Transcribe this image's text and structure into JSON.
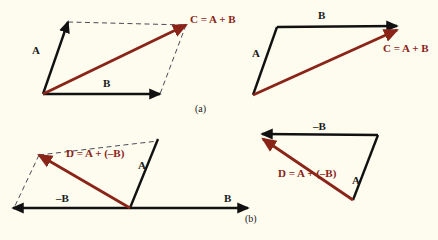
{
  "figure": {
    "background_color": "#fdfcee",
    "vector_black": "#111111",
    "vector_red": "#8b2418",
    "dashed_color": "#4a4a58",
    "width": 438,
    "height": 240
  },
  "panels": [
    {
      "id": "panel-a-parallelogram",
      "caption": "(a)",
      "labels": {
        "a": "A",
        "b": "B",
        "resultant": "C = A + B"
      }
    },
    {
      "id": "panel-a-triangle",
      "labels": {
        "a": "A",
        "b": "B",
        "resultant": "C = A + B"
      }
    },
    {
      "id": "panel-b-parallelogram",
      "caption": "(b)",
      "labels": {
        "a": "A",
        "neg_b": "–B",
        "b": "B",
        "resultant": "D = A + (–B)"
      }
    },
    {
      "id": "panel-b-triangle",
      "labels": {
        "a": "A",
        "neg_b": "–B",
        "resultant": "D = A + (–B)"
      }
    }
  ],
  "labels_flat": {
    "a1_A": "A",
    "a1_B": "B",
    "a1_C": "C = A + B",
    "a2_A": "A",
    "a2_B": "B",
    "a2_C": "C = A + B",
    "caption_a": "(a)",
    "b1_A": "A",
    "b1_negB": "–B",
    "b1_B": "B",
    "b1_D": "D = A + (–B)",
    "b2_A": "A",
    "b2_negB": "–B",
    "b2_D": "D = A + (–B)",
    "caption_b": "(b)"
  }
}
